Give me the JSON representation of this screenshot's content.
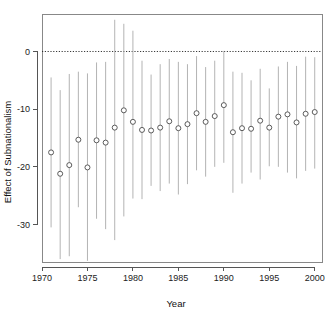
{
  "chart_data": {
    "type": "scatter",
    "title": "",
    "subtitle": "",
    "xlabel": "Year",
    "ylabel": "Effect of Subnationalism",
    "xlim": [
      1970.0,
      2000.8
    ],
    "ylim": [
      -36.5,
      6.5
    ],
    "grid": false,
    "legend": null,
    "x_ticks": [
      1970,
      1975,
      1980,
      1985,
      1990,
      1995,
      2000
    ],
    "x_tick_labels": [
      "1970",
      "1975",
      "1980",
      "1985",
      "1990",
      "1995",
      "2000"
    ],
    "y_ticks": [
      0,
      -10,
      -20,
      -30
    ],
    "y_tick_labels": [
      "0",
      "-10",
      "-20",
      "-30"
    ],
    "annotations": [
      {
        "kind": "hline",
        "y": 0,
        "style": "dotted",
        "label": "zero-reference-line"
      }
    ],
    "marker": "open-circle",
    "errorbar_style": "vertical-line",
    "x": [
      1971,
      1972,
      1973,
      1974,
      1975,
      1976,
      1977,
      1978,
      1979,
      1980,
      1981,
      1982,
      1983,
      1984,
      1985,
      1986,
      1987,
      1988,
      1989,
      1990,
      1991,
      1992,
      1993,
      1994,
      1995,
      1996,
      1997,
      1998,
      1999,
      2000
    ],
    "values": [
      -17.5,
      -21.2,
      -19.7,
      -15.3,
      -20.1,
      -15.4,
      -15.8,
      -13.2,
      -10.2,
      -12.2,
      -13.6,
      -13.7,
      -13.2,
      -12.1,
      -13.3,
      -12.6,
      -10.7,
      -12.2,
      -11.2,
      -9.3,
      -14.0,
      -13.3,
      -13.4,
      -12.0,
      -13.2,
      -11.3,
      -10.9,
      -12.3,
      -10.8,
      -10.5
    ],
    "ci_lower": [
      -30.5,
      -36.0,
      -35.5,
      -27.0,
      -36.3,
      -29.0,
      -30.8,
      -32.7,
      -28.6,
      -25.5,
      -25.6,
      -23.3,
      -24.2,
      -22.9,
      -24.8,
      -23.0,
      -20.6,
      -21.7,
      -20.0,
      -19.3,
      -24.5,
      -22.9,
      -21.0,
      -22.2,
      -19.9,
      -20.0,
      -21.0,
      -22.0,
      -20.7,
      -20.3
    ],
    "ci_upper": [
      -4.5,
      -6.7,
      -3.9,
      -3.5,
      -3.8,
      -1.9,
      -1.8,
      5.5,
      4.8,
      3.6,
      -1.6,
      -4.0,
      -2.2,
      -1.3,
      -1.8,
      -2.2,
      -0.8,
      -2.7,
      -1.6,
      0.1,
      -3.5,
      -3.7,
      -5.0,
      -3.0,
      -6.4,
      -2.6,
      -1.8,
      -2.5,
      -0.9,
      -1.0
    ]
  },
  "figure": {
    "background_color": "#ffffff",
    "marker_edge_color": "#4a4a4a",
    "errorbar_color": "#aaaaaa",
    "axis_color": "#555555"
  }
}
